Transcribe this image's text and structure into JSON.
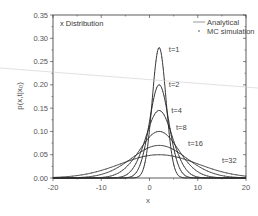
{
  "chart_data": {
    "type": "line",
    "title": "x Distribution",
    "xlabel": "x",
    "ylabel": "p(x,t|x₀)",
    "xlim": [
      -20,
      20
    ],
    "ylim": [
      0.0,
      0.35
    ],
    "xticks": [
      -20,
      -10,
      0,
      10,
      20
    ],
    "xtick_labels": [
      "-20",
      "-10",
      "0",
      "10",
      "20"
    ],
    "yticks": [
      0.0,
      0.05,
      0.1,
      0.15,
      0.2,
      0.25,
      0.3,
      0.35
    ],
    "ytick_labels": [
      "0.00",
      "0.05",
      "0.10",
      "0.15",
      "0.20",
      "0.25",
      "0.30",
      "0.35"
    ],
    "grid": false,
    "legend_position": "upper right",
    "legend": [
      {
        "label": "Analytical",
        "style": "solid line"
      },
      {
        "label": "MC simulation",
        "style": "dots"
      }
    ],
    "center_x": 2,
    "series": [
      {
        "name": "t=1",
        "label": "t=1",
        "peak_x": 2,
        "peak_y": 0.28,
        "sigma": 1.42,
        "label_pos": [
          4.0,
          0.27
        ]
      },
      {
        "name": "t=2",
        "label": "t=2",
        "peak_x": 2,
        "peak_y": 0.2,
        "sigma": 2.0,
        "label_pos": [
          4.0,
          0.195
        ]
      },
      {
        "name": "t=4",
        "label": "t=4",
        "peak_x": 2,
        "peak_y": 0.145,
        "sigma": 2.75,
        "label_pos": [
          4.5,
          0.14
        ]
      },
      {
        "name": "t=8",
        "label": "t=8",
        "peak_x": 2,
        "peak_y": 0.1,
        "sigma": 4.0,
        "label_pos": [
          5.5,
          0.103
        ]
      },
      {
        "name": "t=16",
        "label": "t=16",
        "peak_x": 2,
        "peak_y": 0.07,
        "sigma": 5.7,
        "label_pos": [
          8.0,
          0.068
        ]
      },
      {
        "name": "t=32",
        "label": "t=32",
        "peak_x": 2,
        "peak_y": 0.05,
        "sigma": 8.0,
        "label_pos": [
          15.0,
          0.033
        ]
      }
    ]
  },
  "overlay": {
    "stray_line": {
      "x1": 0,
      "y1": 68,
      "x2": 258,
      "y2": 88,
      "color": "#cccccc"
    }
  },
  "colors": {
    "curve": "#222222",
    "axis": "#333333",
    "text": "#555555"
  }
}
